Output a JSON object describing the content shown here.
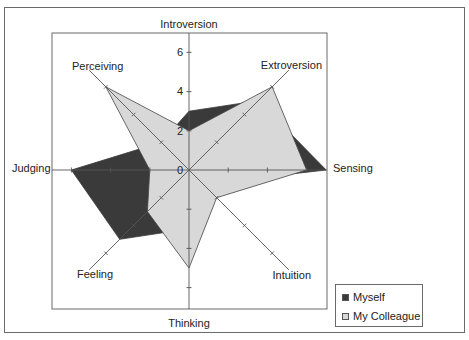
{
  "chart_data": {
    "type": "radar",
    "title": "",
    "axes": [
      "Introversion",
      "Extroversion",
      "Sensing",
      "Intuition",
      "Thinking",
      "Feeling",
      "Judging",
      "Perceiving"
    ],
    "axis_ticks": [
      0,
      2,
      4,
      6
    ],
    "range": [
      0,
      7
    ],
    "series": [
      {
        "name": "Myself",
        "color": "#3a3a3a",
        "values": [
          3,
          5,
          7,
          1,
          3,
          5,
          6,
          2
        ]
      },
      {
        "name": "My Colleague",
        "color": "#d8d8d8",
        "values": [
          2,
          6,
          6,
          2,
          5,
          3,
          2,
          6
        ]
      }
    ],
    "legend_position": "bottom-right"
  },
  "labels": {
    "introversion": "Introversion",
    "extroversion": "Extroversion",
    "sensing": "Sensing",
    "intuition": "Intuition",
    "thinking": "Thinking",
    "feeling": "Feeling",
    "judging": "Judging",
    "perceiving": "Perceiving"
  },
  "ticks": {
    "t0": "0",
    "t2": "2",
    "t4": "4",
    "t6": "6"
  },
  "legend": {
    "items": [
      {
        "label": "Myself",
        "color": "#3a3a3a"
      },
      {
        "label": "My Colleague",
        "color": "#d8d8d8"
      }
    ]
  }
}
